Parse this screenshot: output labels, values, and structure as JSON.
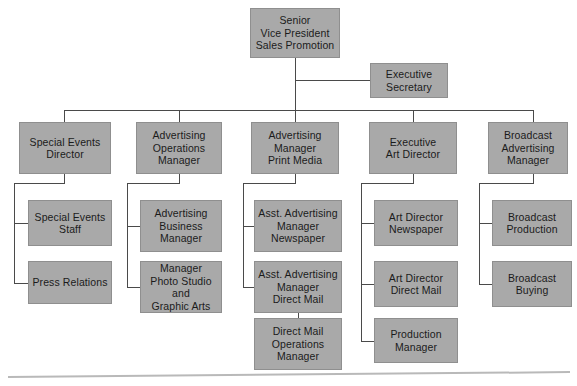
{
  "chart_data": {
    "type": "diagram",
    "diagram_type": "organization-chart",
    "box_fill_color": "#a9a9a9",
    "box_border_color": "#8f8f8f",
    "connector_color": "#4a4a4a",
    "background_color": "#ffffff",
    "baseline_color": "#b9b9b9",
    "levels": 4,
    "node_count": 18,
    "nodes": [
      {
        "id": "svp",
        "label": "Senior\nVice President\nSales Promotion",
        "level": 0,
        "x": 250,
        "y": 8,
        "w": 90,
        "h": 50,
        "parent": null,
        "connector_style": "vertical-center"
      },
      {
        "id": "exec_sec",
        "label": "Executive\nSecretary",
        "level": 1,
        "x": 370,
        "y": 63,
        "w": 78,
        "h": 35,
        "parent": "svp",
        "connector_style": "staff-side"
      },
      {
        "id": "special_events_dir",
        "label": "Special Events\nDirector",
        "level": 1,
        "x": 19,
        "y": 122,
        "w": 92,
        "h": 52,
        "parent": "svp",
        "connector_style": "vertical-center"
      },
      {
        "id": "adv_ops_mgr",
        "label": "Advertising\nOperations\nManager",
        "level": 1,
        "x": 136,
        "y": 122,
        "w": 86,
        "h": 52,
        "parent": "svp",
        "connector_style": "vertical-center"
      },
      {
        "id": "adv_mgr_print",
        "label": "Advertising\nManager\nPrint Media",
        "level": 1,
        "x": 251,
        "y": 122,
        "w": 88,
        "h": 52,
        "parent": "svp",
        "connector_style": "vertical-center"
      },
      {
        "id": "exec_art_dir",
        "label": "Executive\nArt Director",
        "level": 1,
        "x": 369,
        "y": 122,
        "w": 88,
        "h": 52,
        "parent": "svp",
        "connector_style": "vertical-center"
      },
      {
        "id": "broadcast_adv_mgr",
        "label": "Broadcast\nAdvertising\nManager",
        "level": 1,
        "x": 488,
        "y": 122,
        "w": 80,
        "h": 52,
        "parent": "svp",
        "connector_style": "vertical-center"
      },
      {
        "id": "special_events_staff",
        "label": "Special Events\nStaff",
        "level": 2,
        "x": 28,
        "y": 200,
        "w": 84,
        "h": 46,
        "parent": "special_events_dir",
        "connector_style": "elbow-left"
      },
      {
        "id": "press_relations",
        "label": "Press Relations",
        "level": 2,
        "x": 28,
        "y": 261,
        "w": 84,
        "h": 43,
        "parent": "special_events_dir",
        "connector_style": "elbow-left"
      },
      {
        "id": "adv_business_mgr",
        "label": "Advertising\nBusiness\nManager",
        "level": 2,
        "x": 140,
        "y": 200,
        "w": 82,
        "h": 52,
        "parent": "adv_ops_mgr",
        "connector_style": "elbow-left"
      },
      {
        "id": "mgr_photo_studio",
        "label": "Manager\nPhoto Studio and\nGraphic Arts",
        "level": 2,
        "x": 140,
        "y": 261,
        "w": 82,
        "h": 52,
        "parent": "adv_ops_mgr",
        "connector_style": "elbow-left"
      },
      {
        "id": "asst_adv_mgr_news",
        "label": "Asst. Advertising\nManager\nNewspaper",
        "level": 2,
        "x": 254,
        "y": 200,
        "w": 88,
        "h": 52,
        "parent": "adv_mgr_print",
        "connector_style": "elbow-left"
      },
      {
        "id": "asst_adv_mgr_mail",
        "label": "Asst. Advertising\nManager\nDirect Mail",
        "level": 2,
        "x": 254,
        "y": 261,
        "w": 88,
        "h": 52,
        "parent": "adv_mgr_print",
        "connector_style": "elbow-left"
      },
      {
        "id": "direct_mail_ops",
        "label": "Direct Mail\nOperations\nManager",
        "level": 3,
        "x": 254,
        "y": 318,
        "w": 88,
        "h": 52,
        "parent": "asst_adv_mgr_mail",
        "connector_style": "vertical-center"
      },
      {
        "id": "art_dir_news",
        "label": "Art Director\nNewspaper",
        "level": 2,
        "x": 374,
        "y": 200,
        "w": 84,
        "h": 46,
        "parent": "exec_art_dir",
        "connector_style": "elbow-left"
      },
      {
        "id": "art_dir_mail",
        "label": "Art Director\nDirect Mail",
        "level": 2,
        "x": 374,
        "y": 261,
        "w": 84,
        "h": 46,
        "parent": "exec_art_dir",
        "connector_style": "elbow-left"
      },
      {
        "id": "production_mgr",
        "label": "Production\nManager",
        "level": 2,
        "x": 374,
        "y": 318,
        "w": 84,
        "h": 45,
        "parent": "exec_art_dir",
        "connector_style": "elbow-left"
      },
      {
        "id": "broadcast_production",
        "label": "Broadcast\nProduction",
        "level": 2,
        "x": 492,
        "y": 200,
        "w": 80,
        "h": 46,
        "parent": "broadcast_adv_mgr",
        "connector_style": "elbow-left"
      },
      {
        "id": "broadcast_buying",
        "label": "Broadcast\nBuying",
        "level": 2,
        "x": 492,
        "y": 261,
        "w": 80,
        "h": 46,
        "parent": "broadcast_adv_mgr",
        "connector_style": "elbow-left"
      }
    ],
    "connectors": [
      {
        "name": "svp-drop-to-bus",
        "type": "v",
        "x": 295,
        "y": 58,
        "len": 52
      },
      {
        "name": "svp-to-exec-sec",
        "type": "h",
        "x": 295,
        "y": 80,
        "len": 75
      },
      {
        "name": "level1-bus",
        "type": "h",
        "x": 64,
        "y": 110,
        "len": 469
      },
      {
        "name": "bus-to-special-events",
        "type": "v",
        "x": 64,
        "y": 110,
        "len": 12
      },
      {
        "name": "bus-to-adv-ops",
        "type": "v",
        "x": 179,
        "y": 110,
        "len": 12
      },
      {
        "name": "bus-to-adv-print",
        "type": "v",
        "x": 295,
        "y": 110,
        "len": 12
      },
      {
        "name": "bus-to-exec-art",
        "type": "v",
        "x": 413,
        "y": 110,
        "len": 12
      },
      {
        "name": "bus-to-broadcast",
        "type": "v",
        "x": 533,
        "y": 110,
        "len": 12
      },
      {
        "name": "se-drop",
        "type": "v",
        "x": 64,
        "y": 174,
        "len": 9
      },
      {
        "name": "se-across",
        "type": "h",
        "x": 14,
        "y": 183,
        "len": 51
      },
      {
        "name": "se-spine",
        "type": "v",
        "x": 14,
        "y": 183,
        "len": 100
      },
      {
        "name": "se-stub-staff",
        "type": "h",
        "x": 14,
        "y": 223,
        "len": 15
      },
      {
        "name": "se-stub-press",
        "type": "h",
        "x": 14,
        "y": 283,
        "len": 15
      },
      {
        "name": "ao-drop",
        "type": "v",
        "x": 179,
        "y": 174,
        "len": 9
      },
      {
        "name": "ao-across",
        "type": "h",
        "x": 127,
        "y": 183,
        "len": 53
      },
      {
        "name": "ao-spine",
        "type": "v",
        "x": 127,
        "y": 183,
        "len": 104
      },
      {
        "name": "ao-stub-business",
        "type": "h",
        "x": 127,
        "y": 226,
        "len": 14
      },
      {
        "name": "ao-stub-photo",
        "type": "h",
        "x": 127,
        "y": 287,
        "len": 14
      },
      {
        "name": "ap-drop",
        "type": "v",
        "x": 295,
        "y": 174,
        "len": 9
      },
      {
        "name": "ap-across",
        "type": "h",
        "x": 243,
        "y": 183,
        "len": 53
      },
      {
        "name": "ap-spine",
        "type": "v",
        "x": 243,
        "y": 183,
        "len": 104
      },
      {
        "name": "ap-stub-news",
        "type": "h",
        "x": 243,
        "y": 226,
        "len": 12
      },
      {
        "name": "ap-stub-mail",
        "type": "h",
        "x": 243,
        "y": 287,
        "len": 12
      },
      {
        "name": "mail-to-ops",
        "type": "v",
        "x": 298,
        "y": 313,
        "len": 6
      },
      {
        "name": "ea-drop",
        "type": "v",
        "x": 413,
        "y": 174,
        "len": 9
      },
      {
        "name": "ea-across",
        "type": "h",
        "x": 361,
        "y": 183,
        "len": 53
      },
      {
        "name": "ea-spine",
        "type": "v",
        "x": 361,
        "y": 183,
        "len": 158
      },
      {
        "name": "ea-stub-news",
        "type": "h",
        "x": 361,
        "y": 223,
        "len": 14
      },
      {
        "name": "ea-stub-mail",
        "type": "h",
        "x": 361,
        "y": 284,
        "len": 14
      },
      {
        "name": "ea-stub-prod",
        "type": "h",
        "x": 361,
        "y": 341,
        "len": 14
      },
      {
        "name": "ba-drop",
        "type": "v",
        "x": 533,
        "y": 174,
        "len": 9
      },
      {
        "name": "ba-across",
        "type": "h",
        "x": 479,
        "y": 183,
        "len": 55
      },
      {
        "name": "ba-spine",
        "type": "v",
        "x": 479,
        "y": 183,
        "len": 101
      },
      {
        "name": "ba-stub-production",
        "type": "h",
        "x": 479,
        "y": 223,
        "len": 14
      },
      {
        "name": "ba-stub-buying",
        "type": "h",
        "x": 479,
        "y": 284,
        "len": 14
      }
    ],
    "baseline": {
      "x": 8,
      "y": 376,
      "length": 562,
      "rotation_deg": -0.5
    }
  }
}
